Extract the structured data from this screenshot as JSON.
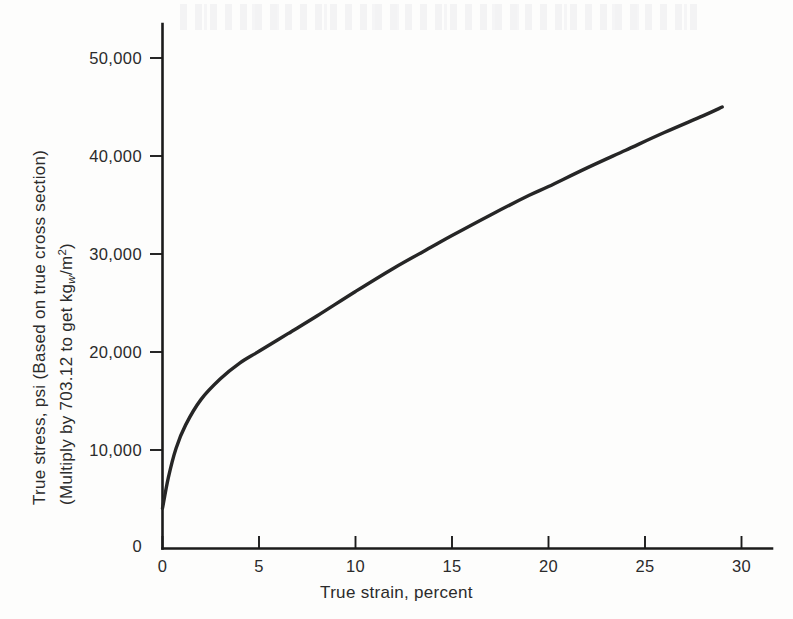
{
  "figure": {
    "background_color": "#fdfdfc",
    "ink_color": "#262626"
  },
  "axes": {
    "y": {
      "title_line1": "True stress, psi (Based on true cross section)",
      "title_line2_pre": "(Multiply by 703.12 to get kg",
      "title_line2_sub": "w",
      "title_line2_mid": "/m",
      "title_line2_sup": "2",
      "title_line2_post": ")",
      "origin_label": "0",
      "ticks": [
        "10,000",
        "20,000",
        "30,000",
        "40,000",
        "50,000"
      ]
    },
    "x": {
      "title": "True strain, percent",
      "ticks": [
        "0",
        "5",
        "10",
        "15",
        "20",
        "25",
        "30"
      ]
    }
  },
  "chart_data": {
    "type": "line",
    "title": "",
    "xlabel": "True strain, percent",
    "ylabel": "True stress, psi (Based on true cross section) (Multiply by 703.12 to get kg_w/m^2)",
    "xlim": [
      0,
      31
    ],
    "ylim": [
      0,
      52500
    ],
    "xticks": [
      0,
      5,
      10,
      15,
      20,
      25,
      30
    ],
    "yticks": [
      10000,
      20000,
      30000,
      40000,
      50000
    ],
    "grid": false,
    "legend": "none",
    "series": [
      {
        "name": "True stress-strain curve",
        "x": [
          0.0,
          0.3,
          0.7,
          1.2,
          2.0,
          3.0,
          4.0,
          5.0,
          6.5,
          8.0,
          10.0,
          12.0,
          14.0,
          15.0,
          17.0,
          19.0,
          20.0,
          22.0,
          24.0,
          26.0,
          28.0,
          29.0
        ],
        "y": [
          4100,
          7200,
          10200,
          12600,
          15200,
          17300,
          18900,
          20100,
          21900,
          23700,
          26200,
          28600,
          30800,
          31900,
          34000,
          36000,
          36900,
          38800,
          40600,
          42400,
          44100,
          45000
        ]
      }
    ]
  }
}
